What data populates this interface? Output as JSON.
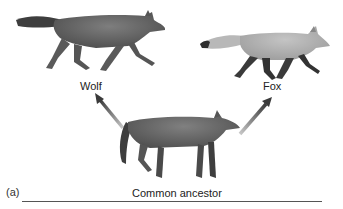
{
  "figure": {
    "top_caption_cropped": "",
    "panel_label": "(a)",
    "labels": {
      "wolf": "Wolf",
      "fox": "Fox",
      "ancestor": "Common ancestor"
    },
    "nodes": [
      {
        "id": "wolf",
        "label": "Wolf",
        "depiction": "gray wolf walking left-to-right, bushy tail"
      },
      {
        "id": "fox",
        "label": "Fox",
        "depiction": "light gray fox walking, dark legs, bushy tail"
      },
      {
        "id": "ancestor",
        "label": "Common ancestor",
        "depiction": "canid standing, facing right"
      }
    ],
    "edges": [
      {
        "from": "ancestor",
        "to": "wolf",
        "style": "gray gradient arrow"
      },
      {
        "from": "ancestor",
        "to": "fox",
        "style": "gray gradient arrow"
      }
    ],
    "colors": {
      "arrow_dark": "#3a3a3a",
      "arrow_light": "#b0b0b0",
      "animal_dark": "#4a4a4a",
      "animal_mid": "#7a7a7a",
      "fox_light": "#a8a8a8",
      "line": "#555555"
    }
  }
}
